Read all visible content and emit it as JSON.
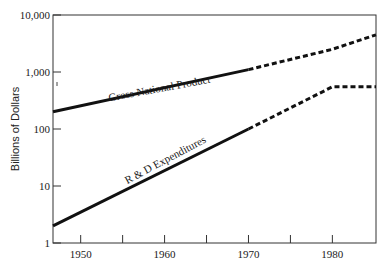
{
  "chart_data": {
    "type": "line",
    "title": "",
    "xlabel": "",
    "ylabel": "Billions of Dollars",
    "yscale": "log",
    "ylim": [
      1,
      10000
    ],
    "xlim": [
      1946.7,
      1985.2
    ],
    "grid": false,
    "legend": "inline labels on lines",
    "y_ticks": [
      {
        "value": 1,
        "label": "1"
      },
      {
        "value": 10,
        "label": "10"
      },
      {
        "value": 100,
        "label": "100"
      },
      {
        "value": 1000,
        "label": "1,000"
      },
      {
        "value": 10000,
        "label": "10,000"
      }
    ],
    "x_ticks": [
      1950,
      1955,
      1960,
      1965,
      1970,
      1975,
      1980
    ],
    "x_tick_labels": [
      {
        "value": 1950,
        "label": "1950"
      },
      {
        "value": 1960,
        "label": "1960"
      },
      {
        "value": 1970,
        "label": "1970"
      },
      {
        "value": 1980,
        "label": "1980"
      }
    ],
    "series": [
      {
        "name": "Gross National Product",
        "solid": {
          "x": [
            1946.7,
            1970
          ],
          "y": [
            200,
            1100
          ]
        },
        "dashed_projection": {
          "x": [
            1970,
            1980,
            1985.2
          ],
          "y": [
            1100,
            2500,
            4500
          ]
        }
      },
      {
        "name": "R & D Expenditures",
        "solid": {
          "x": [
            1946.7,
            1970
          ],
          "y": [
            2,
            100
          ]
        },
        "dashed_projection": {
          "x": [
            1970,
            1980,
            1985.2
          ],
          "y": [
            100,
            550,
            550
          ]
        }
      }
    ],
    "annotations": [
      "Solid lines show actual values; dashed lines show projections"
    ]
  }
}
